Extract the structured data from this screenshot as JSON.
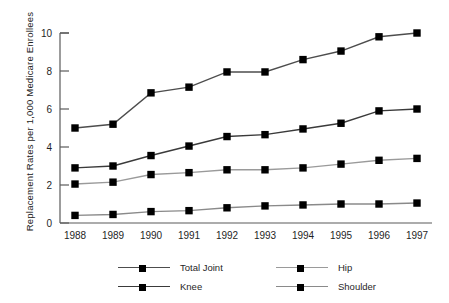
{
  "chart_data": {
    "type": "line",
    "title": "",
    "xlabel": "",
    "ylabel": "Replacement Rates per 1,000 Medicare Enrollees",
    "categories": [
      "1988",
      "1989",
      "1990",
      "1991",
      "1992",
      "1993",
      "1994",
      "1995",
      "1996",
      "1997"
    ],
    "x": [
      1988,
      1989,
      1990,
      1991,
      1992,
      1993,
      1994,
      1995,
      1996,
      1997
    ],
    "ylim": [
      0,
      10
    ],
    "yticks": [
      0,
      2,
      4,
      6,
      8,
      10
    ],
    "ytick_labels": [
      "0",
      "2",
      "4",
      "6",
      "8",
      "10"
    ],
    "grid": false,
    "legend_position": "bottom",
    "series": [
      {
        "name": "Total Joint",
        "color": "#4d4d4d",
        "marker": "square",
        "values": [
          5.0,
          5.2,
          6.85,
          7.15,
          7.95,
          7.95,
          8.6,
          9.05,
          9.8,
          10.0
        ]
      },
      {
        "name": "Knee",
        "color": "#3a3a3a",
        "marker": "square",
        "values": [
          2.9,
          3.0,
          3.55,
          4.05,
          4.55,
          4.65,
          4.95,
          5.25,
          5.9,
          6.0
        ]
      },
      {
        "name": "Hip",
        "color": "#9a9a9a",
        "marker": "square",
        "values": [
          2.05,
          2.15,
          2.55,
          2.65,
          2.8,
          2.8,
          2.9,
          3.1,
          3.3,
          3.4
        ]
      },
      {
        "name": "Shoulder",
        "color": "#8a8a8a",
        "marker": "square",
        "values": [
          0.4,
          0.45,
          0.6,
          0.65,
          0.8,
          0.9,
          0.95,
          1.0,
          1.0,
          1.05
        ]
      }
    ]
  },
  "legend": {
    "items": [
      {
        "label": "Total Joint",
        "color": "#4d4d4d"
      },
      {
        "label": "Hip",
        "color": "#9a9a9a"
      },
      {
        "label": "Knee",
        "color": "#3a3a3a"
      },
      {
        "label": "Shoulder",
        "color": "#8a8a8a"
      }
    ]
  },
  "axes": {
    "y_title": "Replacement Rates per 1,000 Medicare Enrollees",
    "axis_color": "#5a5a5a",
    "marker_color": "#000000"
  }
}
